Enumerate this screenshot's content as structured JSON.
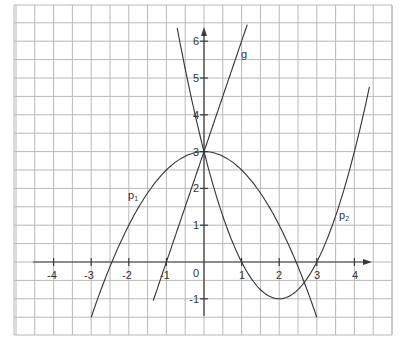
{
  "chart_data": {
    "type": "line",
    "title": "",
    "xlabel": "",
    "ylabel": "",
    "grid": true,
    "grid_step": 0.5,
    "xlim": [
      -5,
      5
    ],
    "ylim": [
      -2,
      7
    ],
    "x_ticks": [
      "-4",
      "-3",
      "-2",
      "-1",
      "0",
      "1",
      "2",
      "3",
      "4"
    ],
    "y_ticks": [
      "-1",
      "1",
      "2",
      "3",
      "4",
      "5",
      "6"
    ],
    "series": [
      {
        "name": "p1",
        "label_main": "p",
        "label_sub": "1",
        "formula": "y = 3 - 0.5x^2",
        "x_range": [
          -3,
          3
        ],
        "points": [
          [
            -3,
            -1.5
          ],
          [
            -2,
            1
          ],
          [
            -1,
            2.5
          ],
          [
            0,
            3
          ],
          [
            1,
            2.5
          ],
          [
            2,
            1
          ],
          [
            3,
            -1.5
          ]
        ]
      },
      {
        "name": "p2",
        "label_main": "p",
        "label_sub": "2",
        "formula": "y = x^2 - 4x + 3",
        "x_range": [
          -0.8,
          4.4
        ],
        "points": [
          [
            -0.8,
            6.84
          ],
          [
            0,
            3
          ],
          [
            1,
            0
          ],
          [
            2,
            -1
          ],
          [
            3,
            0
          ],
          [
            4,
            3
          ],
          [
            4.4,
            4.76
          ]
        ]
      },
      {
        "name": "g",
        "label_main": "g",
        "label_sub": "",
        "formula": "y = 3x + 3",
        "x_range": [
          -1.35,
          1.15
        ],
        "points": [
          [
            -1.35,
            -1.05
          ],
          [
            -1,
            0
          ],
          [
            0,
            3
          ],
          [
            1,
            6
          ],
          [
            1.15,
            6.45
          ]
        ]
      }
    ]
  },
  "labels": {
    "x_ticks": [
      "-4",
      "-3",
      "-2",
      "-1",
      "1",
      "2",
      "3",
      "4"
    ],
    "y_ticks": [
      "-1",
      "1",
      "2",
      "3",
      "4",
      "5",
      "6"
    ],
    "origin": "0",
    "p1_main": "p",
    "p1_sub": "1",
    "p2_main": "p",
    "p2_sub": "2",
    "g": "g"
  }
}
